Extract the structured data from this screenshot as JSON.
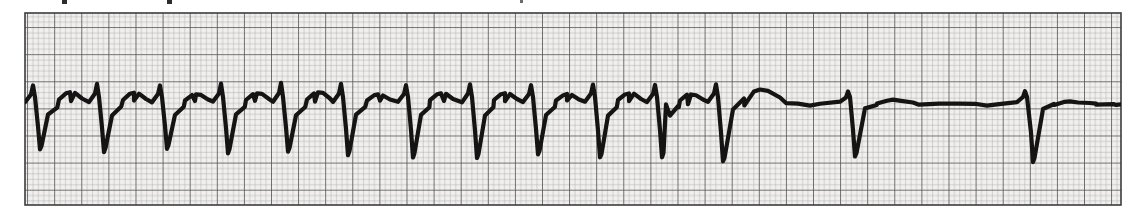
{
  "figure": {
    "kind": "ecg-rhythm-strip",
    "caption": "",
    "paper": {
      "background_color": "#f2f1ef",
      "page_color": "#ffffff",
      "minor_grid_color": "#9a9a9a",
      "major_grid_color": "#4a4a4a",
      "border_color": "#3a3a3a",
      "trace_color": "#1a1a1a",
      "minor_square_px": 5.42,
      "major_square_px": 27.1,
      "grid_left_px": 25,
      "grid_top_px": 13,
      "grid_right_px": 1121,
      "grid_bottom_px": 205
    },
    "top_edge_marks": [
      {
        "name": "remnant-a",
        "x": 62,
        "y": 0
      },
      {
        "name": "remnant-b",
        "x": 167,
        "y": 0
      },
      {
        "name": "remnant-c",
        "x": 520,
        "y": 0
      }
    ]
  },
  "chart_data": {
    "type": "line",
    "title": "",
    "subtitle": "",
    "xlabel": "",
    "ylabel": "",
    "grid": true,
    "legend_position": "none",
    "xlim": [
      25,
      1121
    ],
    "ylim": [
      205,
      13
    ],
    "baseline_y": 103,
    "segments": [
      {
        "name": "tachycardia-run",
        "x_start": 25,
        "x_end": 760,
        "beat_count": 12,
        "rr_interval_px": 62,
        "description": "rapid regular complexes"
      },
      {
        "name": "pause-and-escape",
        "x_start": 760,
        "x_end": 1121,
        "beat_count": 2,
        "rr_interval_px": 177,
        "description": "long pause then slow widely spaced complexes on flat baseline"
      }
    ],
    "beats": [
      {
        "index": 1,
        "r_peak_x": 33,
        "r_peak_y": 86,
        "s_nadir_x": 40,
        "s_nadir_y": 150,
        "t_peak_x": 70,
        "t_peak_y": 92
      },
      {
        "index": 2,
        "r_peak_x": 97,
        "r_peak_y": 84,
        "s_nadir_x": 104,
        "s_nadir_y": 152,
        "t_peak_x": 134,
        "t_peak_y": 93
      },
      {
        "index": 3,
        "r_peak_x": 160,
        "r_peak_y": 85,
        "s_nadir_x": 167,
        "s_nadir_y": 149,
        "t_peak_x": 196,
        "t_peak_y": 94
      },
      {
        "index": 4,
        "r_peak_x": 221,
        "r_peak_y": 84,
        "s_nadir_x": 228,
        "s_nadir_y": 153,
        "t_peak_x": 257,
        "t_peak_y": 93
      },
      {
        "index": 5,
        "r_peak_x": 281,
        "r_peak_y": 83,
        "s_nadir_x": 288,
        "s_nadir_y": 152,
        "t_peak_x": 318,
        "t_peak_y": 92
      },
      {
        "index": 6,
        "r_peak_x": 341,
        "r_peak_y": 84,
        "s_nadir_x": 348,
        "s_nadir_y": 155,
        "t_peak_x": 378,
        "t_peak_y": 94
      },
      {
        "index": 7,
        "r_peak_x": 406,
        "r_peak_y": 85,
        "s_nadir_x": 413,
        "s_nadir_y": 157,
        "t_peak_x": 441,
        "t_peak_y": 93
      },
      {
        "index": 8,
        "r_peak_x": 470,
        "r_peak_y": 84,
        "s_nadir_x": 477,
        "s_nadir_y": 158,
        "t_peak_x": 505,
        "t_peak_y": 93
      },
      {
        "index": 9,
        "r_peak_x": 531,
        "r_peak_y": 85,
        "s_nadir_x": 538,
        "s_nadir_y": 155,
        "t_peak_x": 567,
        "t_peak_y": 94
      },
      {
        "index": 10,
        "r_peak_x": 593,
        "r_peak_y": 84,
        "s_nadir_x": 600,
        "s_nadir_y": 158,
        "t_peak_x": 629,
        "t_peak_y": 93
      },
      {
        "index": 11,
        "r_peak_x": 655,
        "r_peak_y": 85,
        "s_nadir_x": 662,
        "s_nadir_y": 157,
        "t_peak_x": 691,
        "t_peak_y": 94
      },
      {
        "index": 12,
        "r_peak_x": 716,
        "r_peak_y": 84,
        "s_nadir_x": 723,
        "s_nadir_y": 162,
        "t_peak_x": 760,
        "t_peak_y": 90
      },
      {
        "index": 13,
        "r_peak_x": 848,
        "r_peak_y": 92,
        "s_nadir_x": 855,
        "s_nadir_y": 157,
        "t_peak_x": 893,
        "t_peak_y": 100
      },
      {
        "index": 14,
        "r_peak_x": 1025,
        "r_peak_y": 91,
        "s_nadir_x": 1033,
        "s_nadir_y": 162,
        "t_peak_x": 1070,
        "t_peak_y": 101
      }
    ]
  }
}
